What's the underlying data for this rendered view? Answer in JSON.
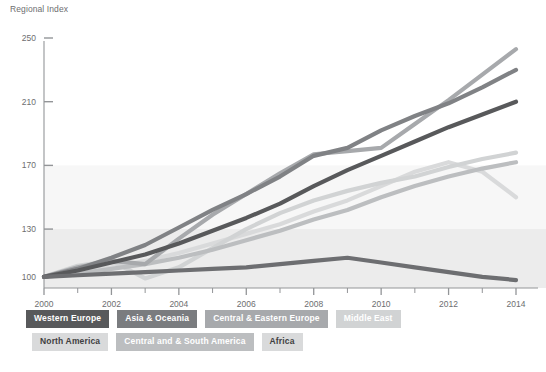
{
  "chart_data": {
    "type": "line",
    "title": "",
    "ylabel": "Regional Index",
    "xlabel": "",
    "ylim": [
      93,
      250
    ],
    "xlim": [
      2000,
      2014
    ],
    "yticks": [
      100,
      130,
      170,
      210,
      250
    ],
    "x": [
      2000,
      2001,
      2002,
      2003,
      2004,
      2005,
      2006,
      2007,
      2008,
      2009,
      2010,
      2011,
      2012,
      2013,
      2014
    ],
    "xtick_labels": [
      "2000",
      "2002",
      "2004",
      "2006",
      "2008",
      "2010",
      "2012",
      "2014"
    ],
    "grid": false,
    "legend_position": "bottom",
    "bands": [
      {
        "from": 130,
        "to": 170,
        "color": "#f7f7f7"
      },
      {
        "from": 93,
        "to": 130,
        "color": "#ececec"
      }
    ],
    "series": [
      {
        "name": "Western Europe",
        "color": "#58595b",
        "values": [
          100,
          104,
          109,
          114,
          121,
          129,
          137,
          146,
          157,
          167,
          176,
          185,
          194,
          202,
          210
        ]
      },
      {
        "name": "Asia & Oceania",
        "color": "#808285",
        "values": [
          100,
          105,
          112,
          120,
          131,
          142,
          152,
          163,
          176,
          181,
          192,
          201,
          209,
          219,
          230
        ]
      },
      {
        "name": "Central & Eastern Europe",
        "color": "#a7a9ac",
        "values": [
          100,
          106,
          110,
          108,
          124,
          139,
          152,
          165,
          177,
          179,
          181,
          196,
          211,
          227,
          243
        ]
      },
      {
        "name": "Middle East",
        "color": "#d1d3d4",
        "values": [
          100,
          107,
          110,
          99,
          106,
          118,
          130,
          140,
          148,
          154,
          159,
          163,
          169,
          174,
          178
        ]
      },
      {
        "name": "North America",
        "color": "#d9dadb",
        "values": [
          100,
          103,
          106,
          110,
          115,
          121,
          127,
          133,
          141,
          148,
          157,
          166,
          172,
          166,
          150
        ]
      },
      {
        "name": "Central and & South America",
        "color": "#bcbec0",
        "values": [
          100,
          102,
          105,
          108,
          112,
          117,
          123,
          129,
          136,
          142,
          150,
          157,
          163,
          168,
          172
        ]
      },
      {
        "name": "Africa",
        "color": "#6d6e71",
        "values": [
          100,
          101,
          102,
          103,
          104,
          105,
          106,
          108,
          110,
          112,
          109,
          106,
          103,
          100,
          98
        ]
      }
    ]
  },
  "legend": {
    "row1": [
      {
        "label": "Western Europe",
        "color": "#58595b",
        "text_color": "#ffffff"
      },
      {
        "label": "Asia & Oceania",
        "color": "#7a7c7f",
        "text_color": "#ffffff"
      },
      {
        "label": "Central & Eastern Europe",
        "color": "#a7a9ac",
        "text_color": "#ffffff"
      },
      {
        "label": "Middle East",
        "color": "#d1d3d4",
        "text_color": "#ffffff"
      }
    ],
    "row2": [
      {
        "label": "North America",
        "color": "#d9dadb",
        "text_color": "#414042"
      },
      {
        "label": "Central and & South America",
        "color": "#bcbec0",
        "text_color": "#ffffff"
      },
      {
        "label": "Africa",
        "color": "#d9dadb",
        "text_color": "#414042"
      }
    ]
  },
  "axis": {
    "axis_color": "#939598",
    "tick_color": "#939598",
    "label_color": "#6d6e70"
  }
}
